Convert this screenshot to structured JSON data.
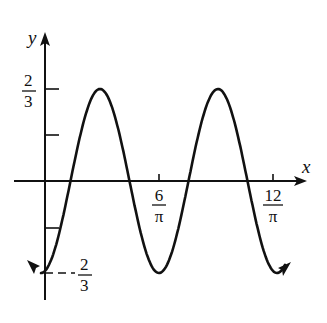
{
  "chart_data": {
    "type": "line",
    "title": "",
    "xlabel": "x",
    "ylabel": "y",
    "function": "y = -(2/3) cos(πx/6)",
    "x_ticks": [
      {
        "value": 0.0,
        "label_num": "",
        "label_den": ""
      },
      {
        "value": 1.9099,
        "label_num": "6",
        "label_den": "π"
      },
      {
        "value": 3.8197,
        "label_num": "12",
        "label_den": "π"
      }
    ],
    "y_ticks": [
      {
        "value": 0.6667,
        "label_num": "2",
        "label_den": "3",
        "sign": ""
      },
      {
        "value": 0.3333,
        "label_num": "",
        "label_den": "",
        "sign": ""
      },
      {
        "value": -0.3333,
        "label_num": "",
        "label_den": "",
        "sign": ""
      },
      {
        "value": -0.6667,
        "label_num": "2",
        "label_den": "3",
        "sign": "-"
      }
    ],
    "amplitude": 0.6667,
    "period": 1.9099,
    "ylim": [
      -0.6667,
      0.6667
    ],
    "grid": false,
    "legend": null,
    "series": [
      {
        "name": "curve",
        "x": [
          0,
          0.4775,
          0.9549,
          1.4324,
          1.9099,
          2.3873,
          2.8648,
          3.3422,
          3.8197
        ],
        "values": [
          -0.6667,
          0,
          0.6667,
          0,
          -0.6667,
          0,
          0.6667,
          0,
          -0.6667
        ]
      }
    ]
  },
  "labels": {
    "x_axis": "x",
    "y_axis": "y",
    "ytop_num": "2",
    "ytop_den": "3",
    "ybot_num": "2",
    "ybot_den": "3",
    "x1_num": "6",
    "x1_den": "π",
    "x2_num": "12",
    "x2_den": "π"
  }
}
